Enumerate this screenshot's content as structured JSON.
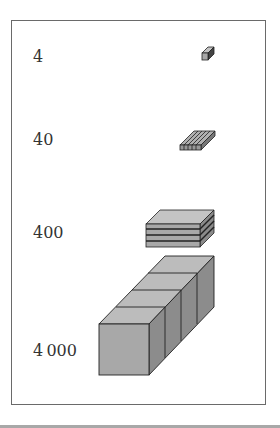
{
  "diagram": {
    "title": "",
    "rows": [
      {
        "label": "4",
        "shape": "small-cube"
      },
      {
        "label": "40",
        "shape": "rod-plate"
      },
      {
        "label": "400",
        "shape": "flat-stack"
      },
      {
        "label": "4 000",
        "shape": "large-cubes"
      }
    ],
    "colors": {
      "face": "#a8a8a8",
      "top": "#c4c4c4",
      "side": "#8a8a8a",
      "edge": "#222222"
    }
  }
}
